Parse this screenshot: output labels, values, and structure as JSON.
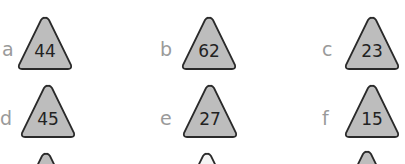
{
  "colors": {
    "fill": "#bdbdbd",
    "stroke": "#2a2a2a",
    "label": "#9a9a9a",
    "fill_light": "#f4f4f4"
  },
  "items": [
    {
      "label": "a",
      "value": "44"
    },
    {
      "label": "b",
      "value": "62"
    },
    {
      "label": "c",
      "value": "23"
    },
    {
      "label": "d",
      "value": "45"
    },
    {
      "label": "e",
      "value": "27"
    },
    {
      "label": "f",
      "value": "15"
    }
  ]
}
